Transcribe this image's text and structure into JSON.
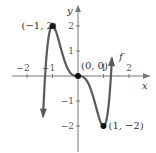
{
  "chart_data": {
    "type": "line",
    "title": "",
    "function_label": "f",
    "xlabel": "x",
    "ylabel": "y",
    "xlim": [
      -2.5,
      2.5
    ],
    "ylim": [
      -2.8,
      2.6
    ],
    "x_ticks": [
      -2,
      -1,
      1,
      2
    ],
    "x_tick_labels": [
      "−2",
      "−1",
      "1",
      "2"
    ],
    "y_ticks": [
      2,
      1,
      -1,
      -2
    ],
    "y_tick_labels": [
      "2",
      "1",
      "−1",
      "−2"
    ],
    "grid": false,
    "series": [
      {
        "name": "f",
        "formula": "f(x) = 3x^5 - 5x^3",
        "x": [
          -1.35,
          -1.25,
          -1.15,
          -1.0,
          -0.8,
          -0.5,
          -0.25,
          0,
          0.25,
          0.5,
          0.8,
          1.0,
          1.15,
          1.25,
          1.35
        ],
        "values": [
          -1.86,
          0.0,
          1.43,
          2.0,
          1.58,
          0.53,
          0.07,
          0,
          -0.07,
          -0.53,
          -1.58,
          -2.0,
          -1.43,
          0.0,
          1.86
        ],
        "color": "#555555",
        "arrows_at_ends": true
      }
    ],
    "annotations": [
      {
        "label": "(−1, 2)",
        "x": -1,
        "y": 2,
        "marker": "dot"
      },
      {
        "label": "(0, 0)",
        "x": 0,
        "y": 0,
        "marker": "dot"
      },
      {
        "label": "(1, −2)",
        "x": 1,
        "y": -2,
        "marker": "dot"
      }
    ]
  }
}
